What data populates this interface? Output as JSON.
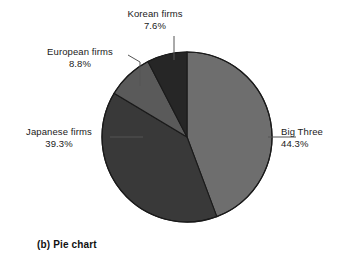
{
  "chart_data": {
    "type": "pie",
    "title": "",
    "caption": "(b) Pie chart",
    "legend_position": "none",
    "labels_position": "outside-with-leader-lines",
    "total_percent": 100.0,
    "start_angle_deg": 0,
    "direction": "clockwise",
    "categories": [
      "Big Three",
      "Japanese firms",
      "European firms",
      "Korean firms"
    ],
    "values": [
      44.3,
      39.3,
      8.8,
      7.6
    ],
    "slices": [
      {
        "name": "Big Three",
        "label": "Big Three",
        "value": 44.3,
        "value_text": "44.3%",
        "color": "#6e6e6e",
        "start_deg": 0.0,
        "end_deg": 159.5,
        "label_side": "right"
      },
      {
        "name": "Japanese firms",
        "label": "Japanese firms",
        "value": 39.3,
        "value_text": "39.3%",
        "color": "#393939",
        "start_deg": 159.5,
        "end_deg": 301.0,
        "label_side": "left"
      },
      {
        "name": "European firms",
        "label": "European firms",
        "value": 8.8,
        "value_text": "8.8%",
        "color": "#5a5a5a",
        "start_deg": 301.0,
        "end_deg": 332.6,
        "label_side": "upper-left"
      },
      {
        "name": "Korean firms",
        "label": "Korean firms",
        "value": 7.6,
        "value_text": "7.6%",
        "color": "#262626",
        "start_deg": 332.6,
        "end_deg": 360.0,
        "label_side": "top"
      }
    ],
    "geometry": {
      "center_x": 187,
      "center_y": 137,
      "radius": 85
    },
    "colors": {
      "background": "#ffffff",
      "outline": "#1a1a1a",
      "leader_line": "#555555",
      "text": "#1a1a1a"
    }
  }
}
